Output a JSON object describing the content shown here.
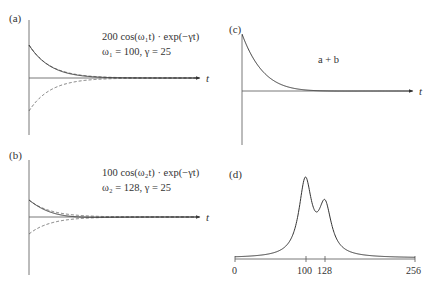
{
  "chart_data": [
    {
      "panel": "(a)",
      "type": "line",
      "title": "",
      "equation_line1": "200 cos(ω1 t) · exp(−γt)",
      "equation_line2": "ω1 = 100,   γ = 25",
      "xlabel": "t",
      "ylabel": "",
      "series": [
        {
          "name": "signal",
          "style": "solid",
          "amplitude": 200,
          "omega": 100,
          "gamma": 25
        },
        {
          "name": "upper envelope",
          "style": "dashed",
          "function": "200·exp(−γt)"
        },
        {
          "name": "lower envelope",
          "style": "dashed",
          "function": "−200·exp(−γt)"
        }
      ],
      "grid": false
    },
    {
      "panel": "(b)",
      "type": "line",
      "title": "",
      "equation_line1": "100 cos(ω2 t) · exp(−γt)",
      "equation_line2": "ω2 = 128,   γ = 25",
      "xlabel": "t",
      "ylabel": "",
      "series": [
        {
          "name": "signal",
          "style": "solid",
          "amplitude": 100,
          "omega": 128,
          "gamma": 25
        },
        {
          "name": "upper envelope",
          "style": "dashed",
          "function": "100·exp(−γt)"
        },
        {
          "name": "lower envelope",
          "style": "dashed",
          "function": "−100·exp(−γt)"
        }
      ],
      "grid": false
    },
    {
      "panel": "(c)",
      "type": "line",
      "title": "a + b",
      "xlabel": "t",
      "ylabel": "",
      "series": [
        {
          "name": "a + b",
          "style": "solid",
          "description": "sum of signals (a) and (b)"
        }
      ],
      "grid": false
    },
    {
      "panel": "(d)",
      "type": "line",
      "title": "",
      "xlabel": "",
      "ylabel": "",
      "x_ticks": [
        "0",
        "100",
        "128",
        "256"
      ],
      "xlim": [
        0,
        256
      ],
      "series": [
        {
          "name": "spectrum",
          "style": "solid",
          "peaks": [
            {
              "x": 100,
              "relative_height": 1.0
            },
            {
              "x": 128,
              "relative_height": 0.65
            }
          ]
        }
      ],
      "grid": false
    }
  ],
  "labels": {
    "a": "(a)",
    "b": "(b)",
    "c": "(c)",
    "d": "(d)",
    "t": "t",
    "a_eq1": "200 cos(ω₁t) · exp(−γt)",
    "a_eq2": "ω₁ = 100,   γ = 25",
    "b_eq1": "100 cos(ω₂t) · exp(−γt)",
    "b_eq2": "ω₂ = 128,   γ = 25",
    "c_title": "a + b",
    "d_tick0": "0",
    "d_tick100": "100",
    "d_tick128": "128",
    "d_tick256": "256"
  }
}
